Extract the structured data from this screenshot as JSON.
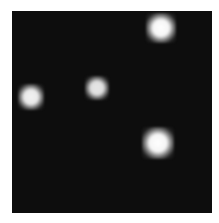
{
  "image": {
    "background_color": "#ffffff",
    "field_color": "#0d0d0d",
    "field": {
      "x": 12,
      "y": 11,
      "width": 200,
      "height": 202
    },
    "spots": [
      {
        "name": "spot-top-right",
        "cx": 161,
        "cy": 28,
        "size": 30,
        "intensity": 1.0
      },
      {
        "name": "spot-left",
        "cx": 31,
        "cy": 97,
        "size": 26,
        "intensity": 0.95
      },
      {
        "name": "spot-middle",
        "cx": 97,
        "cy": 88,
        "size": 24,
        "intensity": 0.9
      },
      {
        "name": "spot-bottom-right",
        "cx": 158,
        "cy": 143,
        "size": 32,
        "intensity": 1.0
      }
    ]
  }
}
